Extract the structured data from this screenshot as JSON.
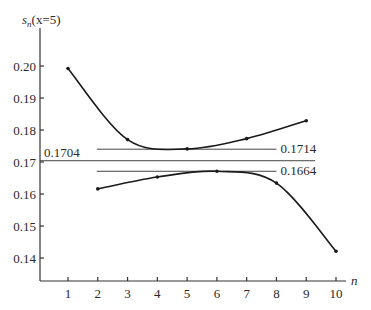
{
  "chart_data": {
    "type": "line",
    "title": "",
    "xlabel": "n",
    "ylabel": "s_n(x=5)",
    "ylabel_main": "s",
    "ylabel_sub": "n",
    "ylabel_arg": "(x=5)",
    "xlim": [
      0,
      10.5
    ],
    "ylim": [
      0.132,
      0.21
    ],
    "grid": false,
    "x_ticks": [
      1,
      2,
      3,
      4,
      5,
      6,
      7,
      8,
      9,
      10
    ],
    "y_ticks": [
      "0.20",
      "0.19",
      "0.18",
      "0.17",
      "0.16",
      "0.15",
      "0.14"
    ],
    "series": [
      {
        "name": "odd n (upper)",
        "x": [
          1,
          3,
          5,
          7,
          9
        ],
        "values": [
          0.1992,
          0.177,
          0.1741,
          0.1773,
          0.1829
        ]
      },
      {
        "name": "even n (lower)",
        "x": [
          2,
          4,
          6,
          8,
          10
        ],
        "values": [
          0.1616,
          0.1653,
          0.1671,
          0.1634,
          0.1421
        ]
      }
    ],
    "reference_lines": [
      {
        "label": "0.1714",
        "y": 0.174,
        "x_from": 2,
        "x_to": 8.0
      },
      {
        "label": "0.1704",
        "y": 0.1704,
        "x_from": 0,
        "x_to": 9.3
      },
      {
        "label": "0.1664",
        "y": 0.1671,
        "x_from": 2,
        "x_to": 8.0
      }
    ]
  }
}
